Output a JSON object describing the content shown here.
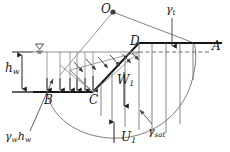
{
  "figure": {
    "colors": {
      "line": "#333333",
      "thick_line": "#111111",
      "light_line": "#8a8a8a",
      "text": "#1a1a1a",
      "background": "#ffffff"
    },
    "labels": {
      "center_of_rotation": "O",
      "crest": "A",
      "slope_top": "D",
      "slope_toe": "C",
      "water_left": "B",
      "water_head": "h",
      "water_head_sub": "w",
      "weight": "W",
      "weight_sub": "1",
      "uplift": "U",
      "uplift_sub": "1",
      "unit_weight_total": "γ",
      "unit_weight_total_sub": "t",
      "unit_weight_sat": "γ",
      "unit_weight_sat_sub": "sat",
      "water_pressure": "γ",
      "water_pressure_sub1": "w",
      "water_pressure_head": "h",
      "water_pressure_sub2": "w"
    },
    "elements": [
      {
        "name": "center-of-rotation-point",
        "kind": "point"
      },
      {
        "name": "failure-arc",
        "kind": "curve"
      },
      {
        "name": "ground-surface-line",
        "kind": "line"
      },
      {
        "name": "slope-face-line",
        "kind": "line"
      },
      {
        "name": "water-table-line",
        "kind": "line"
      },
      {
        "name": "water-table-symbol",
        "kind": "symbol"
      },
      {
        "name": "phreatic-base-line",
        "kind": "line"
      },
      {
        "name": "dashed-water-level-line",
        "kind": "dashed-line"
      },
      {
        "name": "water-head-dimension",
        "kind": "dimension"
      },
      {
        "name": "pore-pressure-distribution",
        "kind": "arrows"
      },
      {
        "name": "slice-lines",
        "kind": "lines"
      },
      {
        "name": "weight-arrow",
        "kind": "arrow"
      },
      {
        "name": "uplift-arrow",
        "kind": "arrow"
      },
      {
        "name": "unit-weight-total-leader",
        "kind": "leader"
      },
      {
        "name": "unit-weight-sat-leader",
        "kind": "leader"
      },
      {
        "name": "water-pressure-leader",
        "kind": "leader"
      }
    ]
  }
}
